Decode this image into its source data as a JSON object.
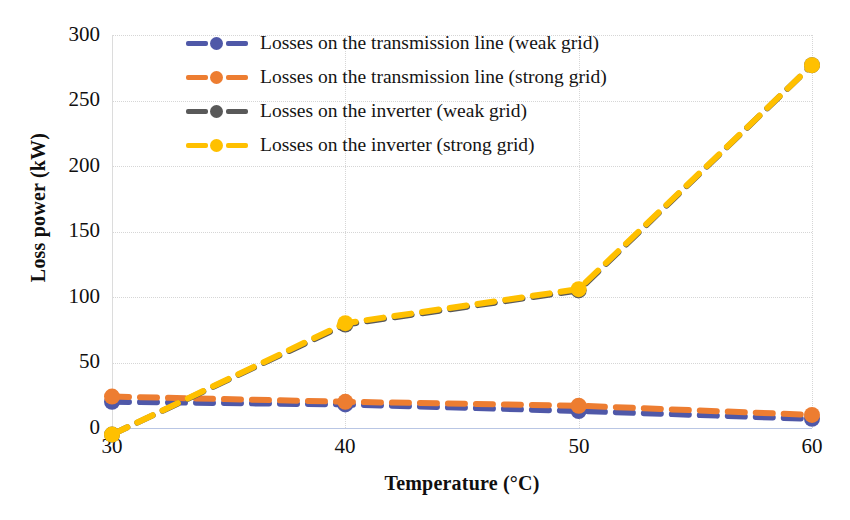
{
  "chart_data": {
    "type": "line",
    "title": "",
    "xlabel": "Temperature (°C)",
    "ylabel": "Loss power (kW)",
    "x": [
      30,
      40,
      50,
      60
    ],
    "xticks": [
      "30",
      "40",
      "50",
      "60"
    ],
    "yticks": [
      "0",
      "50",
      "100",
      "150",
      "200",
      "250",
      "300"
    ],
    "xlim": [
      30,
      60
    ],
    "ylim": [
      -12,
      300
    ],
    "grid": true,
    "legend_position": "top-center",
    "series": [
      {
        "name": "Losses on the transmission line (weak grid)",
        "color": "#4f58a8",
        "values": [
          20,
          18,
          13,
          7
        ],
        "style": "dashed",
        "marker": "circle"
      },
      {
        "name": "Losses on the transmission line (strong grid)",
        "color": "#ed7d31",
        "values": [
          24,
          20,
          17,
          10
        ],
        "style": "dashed",
        "marker": "circle"
      },
      {
        "name": "Losses on the inverter (weak grid)",
        "color": "#595959",
        "values": [
          -5,
          79,
          105,
          277
        ],
        "style": "dashed",
        "marker": "circle"
      },
      {
        "name": "Losses on the inverter (strong grid)",
        "color": "#ffc000",
        "values": [
          -5,
          80,
          106,
          277
        ],
        "style": "dashed",
        "marker": "circle"
      }
    ]
  },
  "legend": {
    "items": [
      {
        "label": "Losses on the transmission line (weak grid)",
        "color": "#4f58a8"
      },
      {
        "label": "Losses on the transmission line (strong grid)",
        "color": "#ed7d31"
      },
      {
        "label": "Losses on the inverter (weak grid)",
        "color": "#595959"
      },
      {
        "label": "Losses on the inverter (strong grid)",
        "color": "#ffc000"
      }
    ]
  },
  "axes": {
    "x_title": "Temperature (°C)",
    "y_title": "Loss power (kW)",
    "x_ticks": [
      "30",
      "40",
      "50",
      "60"
    ],
    "y_ticks": [
      "300",
      "250",
      "200",
      "150",
      "100",
      "50",
      "0"
    ]
  }
}
